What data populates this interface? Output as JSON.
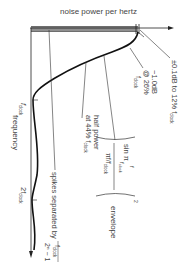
{
  "figure": {
    "y_axis_title": "noise power per hertz",
    "x_axis_title": "frequency",
    "tick_fclock": "f",
    "tick_fclock_sub": "clock",
    "tick_2fclock": "2f",
    "tick_2fclock_sub": "clock",
    "flatness_note": "±0.1dB to 12% f",
    "flatness_note_sub": "clock",
    "rolloff_note_1": "−1.0dB",
    "rolloff_note_2": "@ 26%",
    "rolloff_note_3": "f",
    "rolloff_note_3_sub": "clock",
    "half_power_1": "half power",
    "half_power_2": "at 44% f",
    "half_power_sub": "clock",
    "spikes_note": "spikes separated by",
    "spikes_num": "f",
    "spikes_num_sub": "clock",
    "spikes_den": "2ⁿ − 1",
    "envelope_sin": "sin π",
    "envelope_f": "f",
    "envelope_fclock": "f",
    "envelope_fclock_sub": "clock",
    "envelope_den": "πf/f",
    "envelope_den_sub": "clock",
    "envelope_exp": "2",
    "envelope_label": "envelope"
  },
  "colors": {
    "ink": "#222222",
    "text": "#444444",
    "bar": "#555555"
  }
}
